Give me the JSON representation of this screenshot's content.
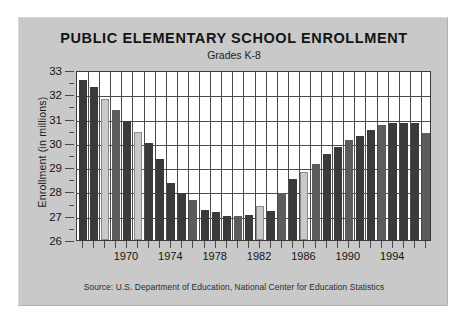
{
  "chart_data": {
    "type": "bar",
    "title": "PUBLIC ELEMENTARY SCHOOL ENROLLMENT",
    "subtitle": "Grades K-8",
    "xlabel": "",
    "ylabel": "Enrollment  (in millions)",
    "source": "Source: U.S. Department of Education, National Center for Education Statistics",
    "ylim": [
      26,
      33
    ],
    "ytick_labels": [
      "26",
      "27",
      "28",
      "29",
      "30",
      "31",
      "32",
      "33"
    ],
    "ytick_values": [
      26,
      27,
      28,
      29,
      30,
      31,
      32,
      33
    ],
    "yminor_values": [
      26.5,
      27.5,
      28.5,
      29.5,
      30.5,
      31.5,
      32.5
    ],
    "xlim": [
      1965.5,
      1997.5
    ],
    "xtick_values": [
      1966,
      1967,
      1968,
      1969,
      1970,
      1971,
      1972,
      1973,
      1974,
      1975,
      1976,
      1977,
      1978,
      1979,
      1980,
      1981,
      1982,
      1983,
      1984,
      1985,
      1986,
      1987,
      1988,
      1989,
      1990,
      1991,
      1992,
      1993,
      1994,
      1995,
      1996,
      1997
    ],
    "xtick_labels": [
      {
        "value": 1970,
        "label": "1970"
      },
      {
        "value": 1974,
        "label": "1974"
      },
      {
        "value": 1978,
        "label": "1978"
      },
      {
        "value": 1982,
        "label": "1982"
      },
      {
        "value": 1986,
        "label": "1986"
      },
      {
        "value": 1990,
        "label": "1990"
      },
      {
        "value": 1994,
        "label": "1994"
      }
    ],
    "gridlines": {
      "horizontal": true,
      "vertical": true
    },
    "legend": null,
    "categories": [
      1966,
      1967,
      1968,
      1969,
      1970,
      1971,
      1972,
      1973,
      1974,
      1975,
      1976,
      1977,
      1978,
      1979,
      1980,
      1981,
      1982,
      1983,
      1984,
      1985,
      1986,
      1987,
      1988,
      1989,
      1990,
      1991,
      1992,
      1993,
      1994,
      1995,
      1996,
      1997
    ],
    "values": [
      32.6,
      32.3,
      31.8,
      31.35,
      30.9,
      30.45,
      30.0,
      29.35,
      28.35,
      27.95,
      27.65,
      27.25,
      27.15,
      27.0,
      26.98,
      27.05,
      27.4,
      27.2,
      27.95,
      28.5,
      28.8,
      29.15,
      29.55,
      29.85,
      30.1,
      30.3,
      30.55,
      30.75,
      30.8,
      30.8,
      30.8,
      30.4
    ],
    "bar_colors": [
      "#3a3a3a",
      "#3a3a3a",
      "#c9c9c9",
      "#5c5c5c",
      "#3a3a3a",
      "#c9c9c9",
      "#3a3a3a",
      "#3a3a3a",
      "#3a3a3a",
      "#3a3a3a",
      "#5c5c5c",
      "#3a3a3a",
      "#3a3a3a",
      "#3a3a3a",
      "#5c5c5c",
      "#3a3a3a",
      "#c9c9c9",
      "#3a3a3a",
      "#5c5c5c",
      "#3a3a3a",
      "#c9c9c9",
      "#5c5c5c",
      "#3a3a3a",
      "#3a3a3a",
      "#5c5c5c",
      "#3a3a3a",
      "#3a3a3a",
      "#5c5c5c",
      "#3a3a3a",
      "#3a3a3a",
      "#3a3a3a",
      "#5c5c5c"
    ],
    "palette": {
      "background": "#c9c9c9",
      "plot_background": "#ffffff",
      "grid": "#4a4a4a",
      "axis": "#3a3a3a",
      "text": "#141414",
      "bar_dark": "#3a3a3a",
      "bar_medium": "#5c5c5c",
      "bar_light": "#c9c9c9"
    }
  }
}
